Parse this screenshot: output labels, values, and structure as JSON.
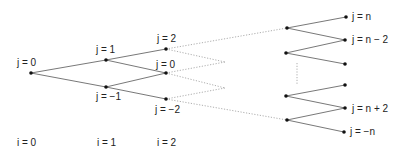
{
  "diagram": {
    "type": "binomial-lattice",
    "nodes": [
      {
        "id": "n00",
        "x": 31,
        "y": 73,
        "label": "j = 0",
        "lx": 17,
        "ly": 66
      },
      {
        "id": "n11",
        "x": 106,
        "y": 60,
        "label": "j = 1",
        "lx": 96,
        "ly": 53
      },
      {
        "id": "n1m1",
        "x": 106,
        "y": 87,
        "label": "j = −1",
        "lx": 96,
        "ly": 100
      },
      {
        "id": "n22",
        "x": 166,
        "y": 49,
        "label": "j = 2",
        "lx": 157,
        "ly": 42
      },
      {
        "id": "n20",
        "x": 166,
        "y": 73,
        "label": "j = 0",
        "lx": 156,
        "ly": 68
      },
      {
        "id": "n2m2",
        "x": 166,
        "y": 99,
        "label": "j = −2",
        "lx": 155,
        "ly": 113
      },
      {
        "id": "a1",
        "x": 287,
        "y": 28,
        "label": ""
      },
      {
        "id": "a2",
        "x": 286,
        "y": 53,
        "label": ""
      },
      {
        "id": "a3",
        "x": 286,
        "y": 96,
        "label": ""
      },
      {
        "id": "a4",
        "x": 287,
        "y": 120,
        "label": ""
      },
      {
        "id": "b1",
        "x": 346,
        "y": 17,
        "label": "j = n",
        "lx": 352,
        "ly": 20
      },
      {
        "id": "b2",
        "x": 345,
        "y": 40,
        "label": "j = n − 2",
        "lx": 352,
        "ly": 43
      },
      {
        "id": "b3",
        "x": 345,
        "y": 64,
        "label": ""
      },
      {
        "id": "b4",
        "x": 345,
        "y": 85,
        "label": ""
      },
      {
        "id": "b5",
        "x": 345,
        "y": 108,
        "label": "j = n + 2",
        "lx": 352,
        "ly": 112
      },
      {
        "id": "b6",
        "x": 344,
        "y": 132,
        "label": "j = −n",
        "lx": 350,
        "ly": 135
      }
    ],
    "edges": [
      {
        "from": "n00",
        "to": "n11"
      },
      {
        "from": "n00",
        "to": "n1m1"
      },
      {
        "from": "n11",
        "to": "n22"
      },
      {
        "from": "n11",
        "to": "n20"
      },
      {
        "from": "n1m1",
        "to": "n20"
      },
      {
        "from": "n1m1",
        "to": "n2m2"
      },
      {
        "from": "a1",
        "to": "b1"
      },
      {
        "from": "a1",
        "to": "b2"
      },
      {
        "from": "a2",
        "to": "b2"
      },
      {
        "from": "a2",
        "to": "b3"
      },
      {
        "from": "a3",
        "to": "b4"
      },
      {
        "from": "a3",
        "to": "b5"
      },
      {
        "from": "a4",
        "to": "b5"
      },
      {
        "from": "a4",
        "to": "b6"
      }
    ],
    "dotted_edges": [
      {
        "x1": 166,
        "y1": 49,
        "x2": 287,
        "y2": 28
      },
      {
        "x1": 166,
        "y1": 49,
        "x2": 225,
        "y2": 62
      },
      {
        "x1": 166,
        "y1": 73,
        "x2": 225,
        "y2": 62
      },
      {
        "x1": 166,
        "y1": 73,
        "x2": 225,
        "y2": 88
      },
      {
        "x1": 166,
        "y1": 99,
        "x2": 225,
        "y2": 88
      },
      {
        "x1": 166,
        "y1": 99,
        "x2": 287,
        "y2": 120
      },
      {
        "x1": 297,
        "y1": 63,
        "x2": 297,
        "y2": 85
      }
    ],
    "step_labels": [
      {
        "text": "i = 0",
        "x": 17,
        "y": 146
      },
      {
        "text": "i = 1",
        "x": 97,
        "y": 146
      },
      {
        "text": "i = 2",
        "x": 157,
        "y": 146
      }
    ]
  }
}
